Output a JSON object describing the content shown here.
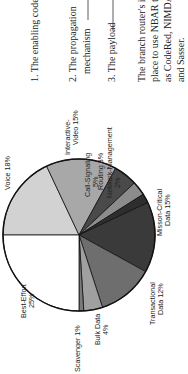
{
  "orientation": "rotated-90-ccw",
  "text_block": {
    "items": [
      {
        "label": "1. The enabling code"
      },
      {
        "label": "2. The propagation",
        "label2": "mechanism"
      },
      {
        "label": "3. The payload"
      }
    ],
    "paragraph": [
      "The branch router's in",
      "place to use NBAR to",
      "as CodeRed, NIMDA,",
      "and Sasser."
    ]
  },
  "chart_data": {
    "type": "pie",
    "title": "",
    "categories": [
      "Voice",
      "Interactive-Video",
      "Call-Signaling",
      "Routing",
      "Network-Management",
      "Mission-Critical Data",
      "Transactional Data",
      "Bulk Data",
      "Scavenger",
      "Best-Effort"
    ],
    "values": [
      18,
      15,
      5,
      3,
      2,
      15,
      12,
      4,
      1,
      25
    ],
    "unit": "%",
    "colors": [
      "#d2d2d2",
      "#a8a8a8",
      "#4a4a4a",
      "#8c8c8c",
      "#2e2e2e",
      "#3a3a3a",
      "#6e6e6e",
      "#a0a0a0",
      "#7a7a7a",
      "#ffffff"
    ],
    "labels": [
      {
        "line1": "Voice 18%",
        "line2": ""
      },
      {
        "line1": "Interactive-",
        "line2": "Video 15%"
      },
      {
        "line1": "Call-Signaling",
        "line2": "5%"
      },
      {
        "line1": "Routing 3%",
        "line2": ""
      },
      {
        "line1": "Network-Management",
        "line2": "2%"
      },
      {
        "line1": "Misson-Critical",
        "line2": "Data 15%"
      },
      {
        "line1": "Transactional",
        "line2": "Data 12%"
      },
      {
        "line1": "Bulk Data",
        "line2": "4%"
      },
      {
        "line1": "Scavenger 1%",
        "line2": ""
      },
      {
        "line1": "Best-Effort",
        "line2": "25%"
      }
    ],
    "start_angle_deg": 180,
    "legend": "none"
  }
}
